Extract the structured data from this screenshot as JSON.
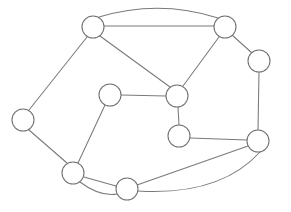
{
  "figure": {
    "background_color": "#ffffff",
    "width": 291,
    "height": 212
  },
  "style": {
    "edge_color": "#7a7a7a",
    "edge_width": 1.05,
    "node_stroke_color": "#6f6f6f",
    "node_fill_color": "#ffffff",
    "node_radius": 11
  },
  "graph": {
    "node_count": 10,
    "edge_count": 16,
    "nodes": [
      {
        "id": "n1",
        "label": "",
        "cx": 93,
        "cy": 27,
        "r": 11
      },
      {
        "id": "n2",
        "label": "",
        "cx": 225,
        "cy": 27,
        "r": 11
      },
      {
        "id": "n3",
        "label": "",
        "cx": 259,
        "cy": 61,
        "r": 11
      },
      {
        "id": "n4",
        "label": "",
        "cx": 23,
        "cy": 120,
        "r": 11
      },
      {
        "id": "n5",
        "label": "",
        "cx": 110,
        "cy": 95,
        "r": 11
      },
      {
        "id": "n6",
        "label": "",
        "cx": 177,
        "cy": 96,
        "r": 11
      },
      {
        "id": "n7",
        "label": "",
        "cx": 179,
        "cy": 136,
        "r": 11
      },
      {
        "id": "n8",
        "label": "",
        "cx": 258,
        "cy": 141,
        "r": 11
      },
      {
        "id": "n9",
        "label": "",
        "cx": 73,
        "cy": 173,
        "r": 11
      },
      {
        "id": "n10",
        "label": "",
        "cx": 127,
        "cy": 189,
        "r": 11
      }
    ],
    "edges": [
      {
        "id": "e1",
        "from": "n1",
        "to": "n2",
        "shape": "straight",
        "path": "M 104 26 L 214 26"
      },
      {
        "id": "e2",
        "from": "n1",
        "to": "n2",
        "shape": "curved",
        "path": "M 99 17 Q 159 -1 218 18"
      },
      {
        "id": "e3",
        "from": "n1",
        "to": "n4",
        "shape": "straight",
        "path": "M 87 37 L 29 110"
      },
      {
        "id": "e4",
        "from": "n1",
        "to": "n6",
        "shape": "straight",
        "path": "M 100 36 L 170 87"
      },
      {
        "id": "e5",
        "from": "n2",
        "to": "n3",
        "shape": "straight",
        "path": "M 232 35 L 252 53"
      },
      {
        "id": "e6",
        "from": "n2",
        "to": "n6",
        "shape": "straight",
        "path": "M 219 37 L 183 86"
      },
      {
        "id": "e7",
        "from": "n3",
        "to": "n8",
        "shape": "straight",
        "path": "M 259 72 L 258 130"
      },
      {
        "id": "e8",
        "from": "n4",
        "to": "n9",
        "shape": "straight",
        "path": "M 29 130 L 67 163"
      },
      {
        "id": "e9",
        "from": "n5",
        "to": "n6",
        "shape": "straight",
        "path": "M 121 95 L 166 96"
      },
      {
        "id": "e10",
        "from": "n5",
        "to": "n9",
        "shape": "straight",
        "path": "M 105 105 L 78 163"
      },
      {
        "id": "e11",
        "from": "n6",
        "to": "n7",
        "shape": "straight",
        "path": "M 178 107 L 179 125"
      },
      {
        "id": "e12",
        "from": "n7",
        "to": "n8",
        "shape": "straight",
        "path": "M 190 138 L 247 140"
      },
      {
        "id": "e13",
        "from": "n9",
        "to": "n10",
        "shape": "straight",
        "path": "M 84 177 L 116 186"
      },
      {
        "id": "e14",
        "from": "n9",
        "to": "n10",
        "shape": "curved",
        "path": "M 80 182 Q 100 197 117 194"
      },
      {
        "id": "e15",
        "from": "n10",
        "to": "n8",
        "shape": "straight",
        "path": "M 137 185 L 248 146"
      },
      {
        "id": "e16",
        "from": "n10",
        "to": "n8",
        "shape": "curved",
        "path": "M 138 191 Q 220 196 260 152"
      }
    ]
  }
}
